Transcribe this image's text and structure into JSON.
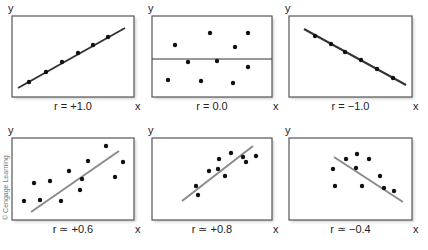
{
  "credit": "© Cengage Learning",
  "colors": {
    "frame": "#555555",
    "shadow": "#d0d0d0",
    "point": "#111111",
    "perfect_line": "#333333",
    "fit_line": "#8a8a8a",
    "zero_line": "#333333"
  },
  "chart_data": [
    {
      "type": "scatter",
      "title": "r = +1.0",
      "xlabel": "x",
      "ylabel": "y",
      "box": [
        12,
        16,
        122,
        81
      ],
      "points": [
        [
          29,
          82
        ],
        [
          46,
          72
        ],
        [
          62,
          62
        ],
        [
          78,
          53
        ],
        [
          93,
          45
        ],
        [
          108,
          37
        ]
      ],
      "line": {
        "from": [
          18,
          88
        ],
        "to": [
          125,
          28
        ],
        "style": "perfect"
      }
    },
    {
      "type": "scatter",
      "title": "r = 0.0",
      "xlabel": "x",
      "ylabel": "y",
      "box": [
        152,
        16,
        120,
        81
      ],
      "points": [
        [
          175,
          45
        ],
        [
          210,
          33
        ],
        [
          248,
          33
        ],
        [
          235,
          47
        ],
        [
          188,
          62
        ],
        [
          217,
          61
        ],
        [
          248,
          67
        ],
        [
          168,
          80
        ],
        [
          201,
          81
        ],
        [
          233,
          83
        ]
      ],
      "line": {
        "from": [
          152,
          59
        ],
        "to": [
          272,
          59
        ],
        "style": "zero"
      }
    },
    {
      "type": "scatter",
      "title": "r = −1.0",
      "xlabel": "x",
      "ylabel": "y",
      "box": [
        289,
        16,
        123,
        81
      ],
      "points": [
        [
          315,
          36
        ],
        [
          331,
          44
        ],
        [
          345,
          52
        ],
        [
          361,
          60
        ],
        [
          377,
          69
        ],
        [
          393,
          78
        ]
      ],
      "line": {
        "from": [
          304,
          29
        ],
        "to": [
          406,
          85
        ],
        "style": "perfect"
      }
    },
    {
      "type": "scatter",
      "title": "r ≃ +0.6",
      "xlabel": "x",
      "ylabel": "y",
      "box": [
        12,
        138,
        122,
        82
      ],
      "points": [
        [
          24,
          201
        ],
        [
          34,
          183
        ],
        [
          40,
          200
        ],
        [
          50,
          181
        ],
        [
          61,
          201
        ],
        [
          69,
          171
        ],
        [
          82,
          179
        ],
        [
          80,
          190
        ],
        [
          88,
          161
        ],
        [
          106,
          146
        ],
        [
          115,
          177
        ],
        [
          123,
          162
        ]
      ],
      "line": {
        "from": [
          31,
          212
        ],
        "to": [
          119,
          151
        ],
        "style": "fit"
      }
    },
    {
      "type": "scatter",
      "title": "r ≃ +0.8",
      "xlabel": "x",
      "ylabel": "y",
      "box": [
        152,
        138,
        120,
        82
      ],
      "points": [
        [
          196,
          186
        ],
        [
          198,
          195
        ],
        [
          209,
          171
        ],
        [
          219,
          159
        ],
        [
          218,
          169
        ],
        [
          225,
          176
        ],
        [
          231,
          153
        ],
        [
          243,
          157
        ],
        [
          246,
          162
        ],
        [
          256,
          156
        ]
      ],
      "line": {
        "from": [
          182,
          201
        ],
        "to": [
          253,
          146
        ],
        "style": "fit"
      }
    },
    {
      "type": "scatter",
      "title": "r ≃ −0.4",
      "xlabel": "x",
      "ylabel": "y",
      "box": [
        289,
        138,
        123,
        82
      ],
      "points": [
        [
          333,
          169
        ],
        [
          335,
          186
        ],
        [
          346,
          159
        ],
        [
          357,
          154
        ],
        [
          356,
          168
        ],
        [
          362,
          186
        ],
        [
          369,
          159
        ],
        [
          380,
          176
        ],
        [
          384,
          188
        ],
        [
          394,
          191
        ]
      ],
      "line": {
        "from": [
          334,
          157
        ],
        "to": [
          403,
          202
        ],
        "style": "fit"
      }
    }
  ]
}
